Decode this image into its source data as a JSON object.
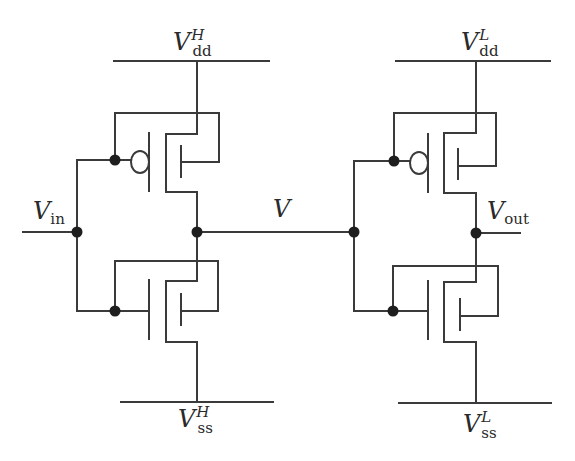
{
  "diagram": {
    "type": "circuit-schematic",
    "colors": {
      "wire": "#3a3a3a",
      "node": "#1e1e1e",
      "background": "#ffffff"
    },
    "labels": {
      "vdd_h": {
        "main": "V",
        "sub": "dd",
        "sup": "H"
      },
      "vss_h": {
        "main": "V",
        "sub": "ss",
        "sup": "H"
      },
      "vdd_l": {
        "main": "V",
        "sub": "dd",
        "sup": "L"
      },
      "vss_l": {
        "main": "V",
        "sub": "ss",
        "sup": "L"
      },
      "vin": {
        "main": "V",
        "sub": "in"
      },
      "v_mid": {
        "main": "V"
      },
      "vout": {
        "main": "V",
        "sub": "out"
      }
    },
    "stages": [
      {
        "name": "high-domain-inverter",
        "supply": "Vdd^H",
        "ground": "Vss^H",
        "input": "Vin",
        "output": "V",
        "transistors": [
          {
            "type": "PMOS",
            "position": "top"
          },
          {
            "type": "NMOS",
            "position": "bottom"
          }
        ]
      },
      {
        "name": "low-domain-inverter",
        "supply": "Vdd^L",
        "ground": "Vss^L",
        "input": "V",
        "output": "Vout",
        "transistors": [
          {
            "type": "PMOS",
            "position": "top"
          },
          {
            "type": "NMOS",
            "position": "bottom"
          }
        ]
      }
    ],
    "nodes": [
      "Vin",
      "V",
      "Vout"
    ]
  }
}
